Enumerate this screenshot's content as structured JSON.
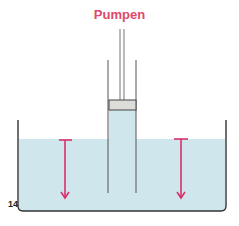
{
  "title": "Pumpen",
  "figure_number": "14",
  "colors": {
    "title": "#e0486a",
    "water": "#cfe6ec",
    "arrow": "#d9306a",
    "outline": "#333333",
    "piston": "#dcdcd8"
  },
  "diagram": {
    "elements": [
      "tank",
      "water",
      "tube",
      "piston",
      "piston-rod",
      "left-arrow-down",
      "right-arrow-down"
    ]
  }
}
